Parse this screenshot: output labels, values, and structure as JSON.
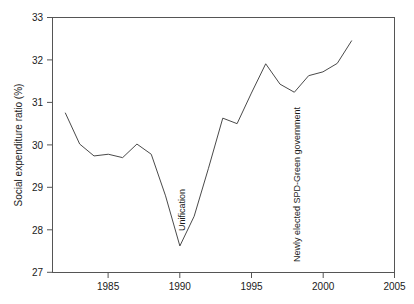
{
  "chart_data": {
    "type": "line",
    "title": "",
    "xlabel": "",
    "ylabel": "Social expenditure ratio (%)",
    "xlim": [
      1981.1,
      2005
    ],
    "ylim": [
      27,
      33
    ],
    "grid": false,
    "legend": "none",
    "x_ticks": [
      "1985",
      "1990",
      "1995",
      "2000",
      "2005"
    ],
    "x_tick_values": [
      1985,
      1990,
      1995,
      2000,
      2005
    ],
    "y_ticks": [
      "27",
      "28",
      "29",
      "30",
      "31",
      "32",
      "33"
    ],
    "y_tick_values": [
      27,
      28,
      29,
      30,
      31,
      32,
      33
    ],
    "x": [
      1982,
      1983,
      1984,
      1985,
      1986,
      1987,
      1988,
      1989,
      1990,
      1991,
      1992,
      1993,
      1994,
      1995,
      1996,
      1997,
      1998,
      1999,
      2000,
      2001,
      2002
    ],
    "values": [
      30.75,
      30.02,
      29.74,
      29.78,
      29.7,
      30.02,
      29.78,
      28.8,
      27.62,
      28.32,
      29.45,
      30.63,
      30.5,
      31.22,
      31.91,
      31.43,
      31.24,
      31.63,
      31.72,
      31.92,
      32.45
    ],
    "series": [
      {
        "name": "Social expenditure ratio",
        "values": [
          30.75,
          30.02,
          29.74,
          29.78,
          29.7,
          30.02,
          29.78,
          28.8,
          27.62,
          28.32,
          29.45,
          30.63,
          30.5,
          31.22,
          31.91,
          31.43,
          31.24,
          31.63,
          31.72,
          31.92,
          32.45
        ]
      }
    ],
    "annotations": [
      {
        "text": "Unification",
        "x": 1990,
        "orientation": "vertical"
      },
      {
        "text": "Newly elected SPD-Green government",
        "x": 1998,
        "orientation": "vertical"
      }
    ]
  }
}
